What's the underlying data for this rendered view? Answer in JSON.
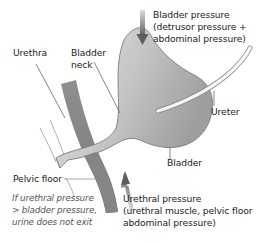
{
  "labels": {
    "urethra": "Urethra",
    "bladder_neck_1": "Bladder",
    "bladder_neck_2": "neck",
    "bladder_pressure_1": "Bladder pressure",
    "bladder_pressure_2": "(detrusor pressure +",
    "bladder_pressure_3": "abdominal pressure)",
    "ureter": "Ureter",
    "bladder": "Bladder",
    "pelvic_floor": "Pelvic floor",
    "urethral_pressure_1": "Urethral pressure",
    "urethral_pressure_2": "(urethral muscle, pelvic floor",
    "urethral_pressure_3": "abdominal pressure)"
  },
  "note": {
    "line1": "If urethral pressure",
    "line2": "> bladder pressure,",
    "line3": "urine does not exit"
  },
  "colors": {
    "bladder_fill_light": "#e4e4e4",
    "bladder_fill_dark": "#a6a6a6",
    "pelvic_floor": "#8a8a8a",
    "arrow": "#777777",
    "leader_line": "#555555"
  }
}
